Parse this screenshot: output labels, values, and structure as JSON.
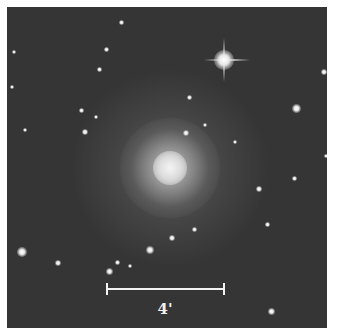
{
  "image": {
    "type": "astronomical-galaxy-field",
    "background_color": "#353535",
    "frame_color": "#ffffff",
    "galaxy": {
      "center": [
        170,
        168
      ],
      "core_color": "#d8d8d8"
    },
    "bright_star": {
      "position": [
        224,
        60
      ]
    }
  },
  "scale_bar": {
    "label": "4'",
    "color": "#f2f2f2"
  }
}
